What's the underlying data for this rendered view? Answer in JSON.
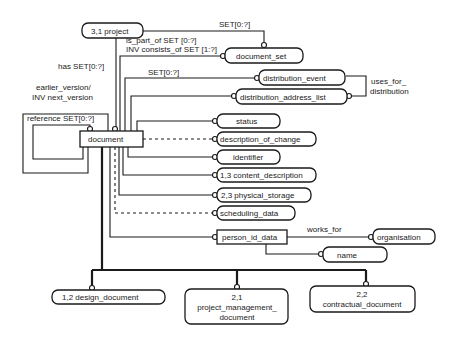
{
  "diagram": {
    "type": "EXPRESS-G entity relationship diagram",
    "entities": {
      "project": "3,1 project",
      "document_set": "document_set",
      "distribution_event": "distribution_event",
      "distribution_address_list": "distribution_address_list",
      "status": "status",
      "description_of_change": "description_of_change",
      "identifier": "identifier",
      "content_description": "1,3 content_description",
      "physical_storage": "2,3 physical_storage",
      "scheduling_data": "scheduling_data",
      "document": "document",
      "person_id_data": "person_id_data",
      "organisation": "organisation",
      "name": "name",
      "design_document": "1,2 design_document",
      "project_management_document": [
        "2,1",
        "project_management_",
        "document"
      ],
      "contractual_document": [
        "2,2",
        "contractual_document"
      ]
    },
    "labels": {
      "set_project": "SET[0:?]",
      "is_part_of": "is_part_of SET [0:?]",
      "inv_consists_of": "INV consists_of SET [1:?]",
      "has_set": "has SET[0:?]",
      "set_distribution": "SET[0:?]",
      "earlier_version": "earlier_version/",
      "inv_next_version": "INV next_version",
      "reference_set": "reference SET[0:?]",
      "uses_for": "uses_for_",
      "distribution": "distribution",
      "works_for": "works_for"
    }
  }
}
